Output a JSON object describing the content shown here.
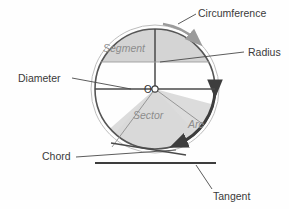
{
  "figure": {
    "background_color": "#fefefe",
    "stroke_color": "#4a4a4a",
    "outer_circle_color": "#b8b8b8",
    "fill_gray": "#d4d4d4",
    "fill_gray_light": "#dcdcdc",
    "label_color": "#3a3a3a",
    "inner_label_color": "#8d8d8d"
  },
  "circle": {
    "center_x": 155,
    "center_y": 89,
    "radius": 60,
    "outer_radius": 64,
    "center_label": "O"
  },
  "inner_labels": [
    {
      "id": "segment",
      "text": "Segment",
      "x": 103,
      "y": 52
    },
    {
      "id": "sector",
      "text": "Sector",
      "x": 133,
      "y": 119
    },
    {
      "id": "arc",
      "text": "Arc",
      "x": 188,
      "y": 128
    }
  ],
  "callouts": [
    {
      "id": "circumference",
      "text": "Circumference",
      "x": 198,
      "y": 17,
      "anchor": "start"
    },
    {
      "id": "radius",
      "text": "Radius",
      "x": 248,
      "y": 56,
      "anchor": "start"
    },
    {
      "id": "diameter",
      "text": "Diameter",
      "x": 18,
      "y": 82,
      "anchor": "start"
    },
    {
      "id": "chord",
      "text": "Chord",
      "x": 42,
      "y": 160,
      "anchor": "start"
    },
    {
      "id": "tangent",
      "text": "Tangent",
      "x": 213,
      "y": 200,
      "anchor": "start"
    }
  ],
  "leader_lines": [
    {
      "id": "circumference-leader",
      "x1": 196,
      "y1": 14,
      "x2": 176,
      "y2": 24
    },
    {
      "id": "radius-leader",
      "x1": 244,
      "y1": 52,
      "x2": 160,
      "y2": 62
    },
    {
      "id": "diameter-leader",
      "x1": 72,
      "y1": 78,
      "x2": 131,
      "y2": 89
    },
    {
      "id": "chord-leader",
      "x1": 76,
      "y1": 157,
      "x2": 176,
      "y2": 150
    },
    {
      "id": "tangent-leader",
      "x1": 212,
      "y1": 189,
      "x2": 196,
      "y2": 165
    }
  ],
  "tangent_line": {
    "x1": 95,
    "y1": 163,
    "x2": 216,
    "y2": 163
  },
  "segment_chord_y": 62,
  "diameter_y": 89
}
